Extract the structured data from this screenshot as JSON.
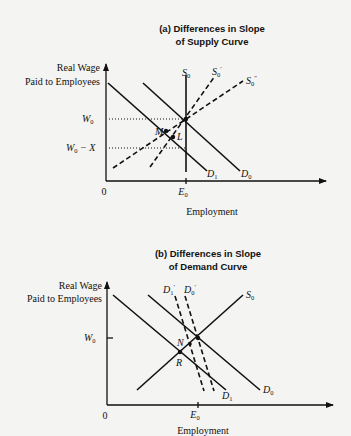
{
  "panel_a": {
    "title_line1": "(a)  Differences in Slope",
    "title_line2": "of Supply Curve",
    "y_axis_label_line1": "Real Wage",
    "y_axis_label_line2": "Paid to Employees",
    "x_axis_label": "Employment",
    "origin": "0",
    "y_ticks": [
      {
        "base": "W",
        "sub": "0",
        "suffix": ""
      },
      {
        "base": "W",
        "sub": "0",
        "suffix": " − X"
      }
    ],
    "x_tick": {
      "base": "E",
      "sub": "0"
    },
    "curves": {
      "S0": {
        "base": "S",
        "sub": "0",
        "prime": ""
      },
      "S0p": {
        "base": "S",
        "sub": "0",
        "prime": "′"
      },
      "S0pp": {
        "base": "S",
        "sub": "0",
        "prime": "″"
      },
      "D1": {
        "base": "D",
        "sub": "1"
      },
      "D0": {
        "base": "D",
        "sub": "0"
      }
    },
    "points": {
      "M": "M",
      "L": "L"
    }
  },
  "panel_b": {
    "title_line1": "(b)  Differences in Slope",
    "title_line2": "of Demand Curve",
    "y_axis_label_line1": "Real Wage",
    "y_axis_label_line2": "Paid to Employees",
    "x_axis_label": "Employment",
    "origin": "0",
    "y_tick": {
      "base": "W",
      "sub": "0"
    },
    "x_tick": {
      "base": "E",
      "sub": "0"
    },
    "curves": {
      "S0": {
        "base": "S",
        "sub": "0"
      },
      "D1p": {
        "base": "D",
        "sub": "1",
        "prime": "′"
      },
      "D0p": {
        "base": "D",
        "sub": "0",
        "prime": "′"
      },
      "D1": {
        "base": "D",
        "sub": "1"
      },
      "D0": {
        "base": "D",
        "sub": "0"
      }
    },
    "points": {
      "N": "N",
      "R": "R"
    }
  }
}
